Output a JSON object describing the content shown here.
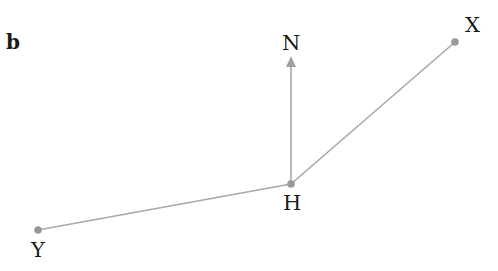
{
  "panel_label": "b",
  "colors": {
    "line": "#a8a8a8",
    "point": "#999999",
    "text": "#1a1a1a"
  },
  "points": {
    "N": {
      "label": "N",
      "x": 291,
      "y": 57
    },
    "X": {
      "label": "X",
      "x": 455,
      "y": 42
    },
    "H": {
      "label": "H",
      "x": 291,
      "y": 184
    },
    "Y": {
      "label": "Y",
      "x": 38,
      "y": 230
    }
  },
  "segments": [
    {
      "from": "H",
      "to": "X"
    },
    {
      "from": "H",
      "to": "Y"
    },
    {
      "from": "H",
      "to": "N",
      "arrow": true
    }
  ]
}
